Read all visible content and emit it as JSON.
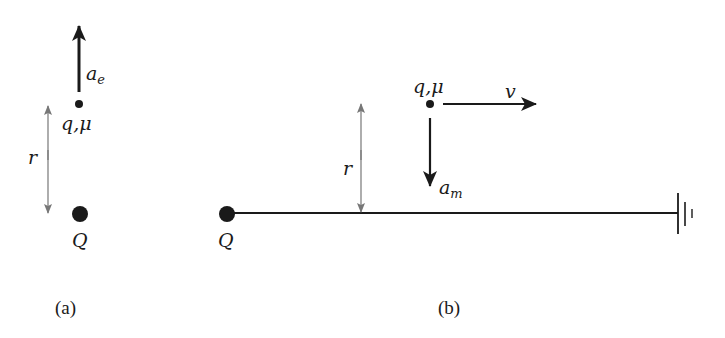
{
  "panel_a": {
    "caption": "(a)",
    "charge_label": "q,μ",
    "source_label": "Q",
    "distance_label": "r",
    "acceleration_label": "a",
    "acceleration_subscript": "e"
  },
  "panel_b": {
    "caption": "(b)",
    "charge_label": "q,μ",
    "source_label": "Q",
    "distance_label": "r",
    "velocity_label": "v",
    "acceleration_label": "a",
    "acceleration_subscript": "m",
    "ground_symbol": "ground-icon"
  },
  "colors": {
    "ink": "#1a1a1a",
    "dimension_line": "#777777"
  }
}
